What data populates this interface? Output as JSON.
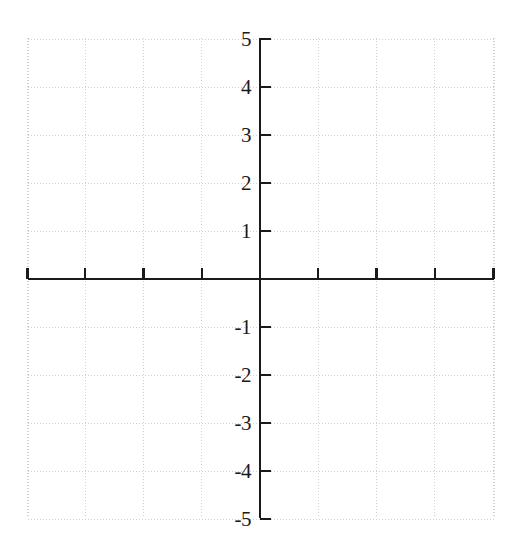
{
  "chart_data": {
    "type": "scatter",
    "title": "",
    "subtitle": "",
    "xlabel": "",
    "ylabel": "",
    "xlim": [
      -4,
      4
    ],
    "ylim": [
      -5,
      5
    ],
    "grid": true,
    "legend": null,
    "series": [],
    "x": [],
    "values": [],
    "annotations": [],
    "x_ticks": [
      {
        "value": -4,
        "label": ""
      },
      {
        "value": -3,
        "label": ""
      },
      {
        "value": -2,
        "label": ""
      },
      {
        "value": -1,
        "label": ""
      },
      {
        "value": 1,
        "label": ""
      },
      {
        "value": 2,
        "label": ""
      },
      {
        "value": 3,
        "label": ""
      },
      {
        "value": 4,
        "label": ""
      }
    ],
    "y_ticks": [
      {
        "value": 5,
        "label": "5"
      },
      {
        "value": 4,
        "label": "4"
      },
      {
        "value": 3,
        "label": "3"
      },
      {
        "value": 2,
        "label": "2"
      },
      {
        "value": 1,
        "label": "1"
      },
      {
        "value": -1,
        "label": "-1"
      },
      {
        "value": -2,
        "label": "-2"
      },
      {
        "value": -3,
        "label": "-3"
      },
      {
        "value": -4,
        "label": "-4"
      },
      {
        "value": -5,
        "label": "-5"
      }
    ],
    "colors": {
      "background": "#ffffff",
      "axis": "#1a1a1a",
      "grid": "#c8c8c8",
      "tick_label": "#1a1a1a"
    }
  },
  "geometry": {
    "width": 523,
    "height": 554,
    "origin_x": 260,
    "origin_y": 279,
    "unit_x": 58.25,
    "unit_y": 48,
    "grid_left": 28,
    "grid_right": 494,
    "grid_top": 38,
    "grid_bottom": 518,
    "x_tick_length": 11,
    "y_tick_length": 11,
    "label_offset": 9
  }
}
